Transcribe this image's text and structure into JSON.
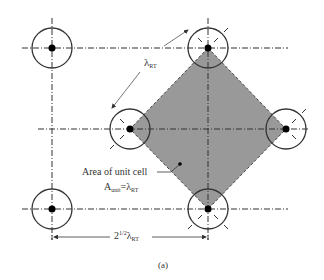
{
  "figure": {
    "caption": "(a)",
    "colors": {
      "background": "#ffffff",
      "unit_cell_fill": "#999999",
      "line": "#333333",
      "center_dot": "#000000"
    },
    "labels": {
      "lambda_side": {
        "symbol": "λ",
        "subscript": "RT"
      },
      "area_title": "Area of unit cell",
      "area_formula": {
        "lhs": "A",
        "lhs_sub": "unit",
        "eq": "=λ",
        "rhs_sub": "RT"
      },
      "diagonal": {
        "base": "2",
        "sup": "1/2",
        "symbol": "λ",
        "subscript": "RT"
      }
    },
    "nodes": [
      {
        "id": "top-left",
        "cx": 52,
        "cy": 48,
        "r": 20
      },
      {
        "id": "top-center",
        "cx": 208,
        "cy": 48,
        "r": 20
      },
      {
        "id": "middle-left",
        "cx": 130,
        "cy": 129,
        "r": 20
      },
      {
        "id": "middle-right",
        "cx": 286,
        "cy": 129,
        "r": 20
      },
      {
        "id": "bottom-left",
        "cx": 52,
        "cy": 209,
        "r": 20
      },
      {
        "id": "bottom-center",
        "cx": 208,
        "cy": 209,
        "r": 20
      }
    ],
    "unit_cell_vertices": [
      [
        208,
        48
      ],
      [
        286,
        129
      ],
      [
        208,
        209
      ],
      [
        130,
        129
      ]
    ]
  }
}
